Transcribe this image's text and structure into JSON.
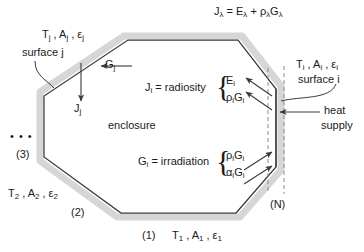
{
  "figure": {
    "type": "technical-diagram",
    "enclosure_label": "enclosure",
    "top_equation": {
      "lhs": "J",
      "lhs_sub": "λ",
      "eq": "=",
      "t1": "E",
      "t1_sub": "λ",
      "plus": "+",
      "t2": "ρ",
      "t2_sub": "λ",
      "t3": "G",
      "t3_sub": "λ"
    },
    "surface_j": {
      "properties": "T",
      "properties_sub1": "j",
      "properties_mid": " , A",
      "properties_sub2": "j",
      "properties_end": " , ε",
      "properties_sub3": "j",
      "name": "surface j",
      "incoming": "G",
      "incoming_sub": "j",
      "outgoing": "J",
      "outgoing_sub": "j"
    },
    "surface_i": {
      "properties": "T",
      "properties_sub1": "i",
      "properties_mid": " , A",
      "properties_sub2": "i",
      "properties_end": " , ε",
      "properties_sub3": "i",
      "name": "surface i",
      "heat_supply": "heat",
      "heat_supply_2": "supply"
    },
    "radiosity": {
      "label": "J",
      "label_sub": "i",
      "label_text": " = radiosity",
      "terms": [
        {
          "main": "E",
          "sub": "i"
        },
        {
          "pre": "ρ",
          "pre_sub": "i",
          "main": "G",
          "sub": "i"
        }
      ]
    },
    "irradiation": {
      "label": "G",
      "label_sub": "i",
      "label_text": " = irradiation",
      "terms": [
        {
          "pre": "ρ",
          "pre_sub": "i",
          "main": "G",
          "sub": "i"
        },
        {
          "pre": "α",
          "pre_sub": "i",
          "main": "G",
          "sub": "i"
        }
      ]
    },
    "surfaces": {
      "ellipsis": "• • •",
      "s3": "(3)",
      "s2": "(2)",
      "s1": "(1)",
      "sN": "(N)",
      "s2_props": {
        "t": "T",
        "t_sub": "2",
        "a": " , A",
        "a_sub": "2",
        "e": " , ε",
        "e_sub": "2"
      },
      "s1_props": {
        "t": "T",
        "t_sub": "1",
        "a": " , A",
        "a_sub": "1",
        "e": " , ε",
        "e_sub": "1"
      }
    },
    "colors": {
      "line": "#3a3a3a",
      "wall_shadow": "#d4d4d4",
      "dashed": "#8a8a8a",
      "text": "#1a1a1a",
      "background": "#ffffff"
    }
  }
}
